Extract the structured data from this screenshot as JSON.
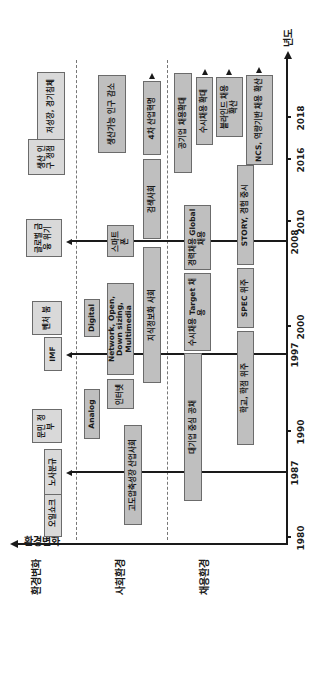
{
  "diagram": {
    "axis_label_top": "환경변화",
    "axis_label_year": "년도",
    "rows": {
      "env": "",
      "social": "사회환경",
      "hiring": "채용환경"
    },
    "years": [
      "1980",
      "1987",
      "1990",
      "1997",
      "2000",
      "2008",
      "2010",
      "2016",
      "2018"
    ],
    "events": [
      {
        "label": "오일쇼크"
      },
      {
        "label": "노사분규"
      },
      {
        "label": "문민 정부"
      },
      {
        "label": "IMF"
      },
      {
        "label": "벤처 붐"
      },
      {
        "label": "글로벌 금융 위기"
      },
      {
        "label": "생산 인구 정점"
      },
      {
        "label": "저성장, 경기침체"
      }
    ],
    "social": [
      {
        "label": "고도압축성장 산업사회"
      },
      {
        "label": "Analog"
      },
      {
        "label": "Digital"
      },
      {
        "label": "인터넷"
      },
      {
        "label": "Network, Open, Down sizing, Multimedia"
      },
      {
        "label": "스마트 폰"
      },
      {
        "label": "지식정보화 사회"
      },
      {
        "label": "검색사회"
      },
      {
        "label": "4차 산업혁명"
      },
      {
        "label": "생산가능 인구 감소"
      }
    ],
    "hiring": [
      {
        "label": "대기업 중심 공채"
      },
      {
        "label": "수시채용 Target 채용"
      },
      {
        "label": "경력채용 Global 채용"
      },
      {
        "label": "공기업 채용확대"
      },
      {
        "label": "수시채용 확대"
      },
      {
        "label": "학교, 학점 위주"
      },
      {
        "label": "SPEC 위주"
      },
      {
        "label": "STORY, 경험 중시"
      },
      {
        "label": "블라인드 채용 확산"
      },
      {
        "label": "NCS, 역량기반 채용 확산"
      }
    ]
  }
}
